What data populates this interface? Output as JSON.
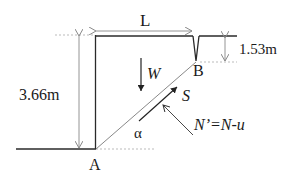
{
  "diagram": {
    "type": "slope-stability-wedge",
    "labels": {
      "length": "L",
      "height": "3.66m",
      "crack_depth": "1.53m",
      "weight": "W",
      "shear": "S",
      "normal": "N’=N-u",
      "angle": "α",
      "point_a": "A",
      "point_b": "B"
    },
    "colors": {
      "line": "#2a2a2a",
      "dimension": "#888888",
      "dashed": "#aaaaaa"
    }
  }
}
